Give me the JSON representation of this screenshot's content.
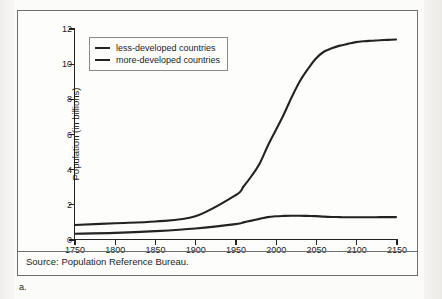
{
  "figure": {
    "label": "a.",
    "source": "Source: Population Reference Bureau."
  },
  "legend": {
    "position": "top-left-inside",
    "items": [
      {
        "label": "less-developed countries",
        "color": "#232323"
      },
      {
        "label": "more-developed countries",
        "color": "#232323"
      }
    ]
  },
  "chart_data": {
    "type": "line",
    "title": "",
    "subtitle": "",
    "xlabel": "",
    "ylabel": "Population (in billions)",
    "xlim": [
      1750,
      2150
    ],
    "ylim": [
      0,
      12
    ],
    "grid": false,
    "legend_position": "upper left",
    "xticks": [
      1750,
      1800,
      1850,
      1900,
      1950,
      2000,
      2050,
      2100,
      2150
    ],
    "yticks": [
      0,
      2,
      4,
      6,
      8,
      10,
      12
    ],
    "x": [
      1750,
      1800,
      1850,
      1900,
      1950,
      1960,
      1970,
      1980,
      1990,
      2000,
      2010,
      2020,
      2030,
      2040,
      2050,
      2060,
      2070,
      2080,
      2090,
      2100,
      2110,
      2120,
      2130,
      2140,
      2150
    ],
    "series": [
      {
        "name": "less-developed countries",
        "color": "#232323",
        "values": [
          0.8,
          0.9,
          1.0,
          1.3,
          2.5,
          3.0,
          3.6,
          4.3,
          5.3,
          6.2,
          7.1,
          8.1,
          9.0,
          9.7,
          10.3,
          10.7,
          10.9,
          11.05,
          11.15,
          11.25,
          11.3,
          11.33,
          11.36,
          11.38,
          11.4
        ]
      },
      {
        "name": "more-developed countries",
        "color": "#232323",
        "values": [
          0.3,
          0.35,
          0.45,
          0.6,
          0.85,
          0.95,
          1.05,
          1.15,
          1.25,
          1.3,
          1.32,
          1.33,
          1.33,
          1.32,
          1.31,
          1.28,
          1.26,
          1.25,
          1.24,
          1.24,
          1.24,
          1.24,
          1.25,
          1.25,
          1.25
        ]
      }
    ]
  }
}
